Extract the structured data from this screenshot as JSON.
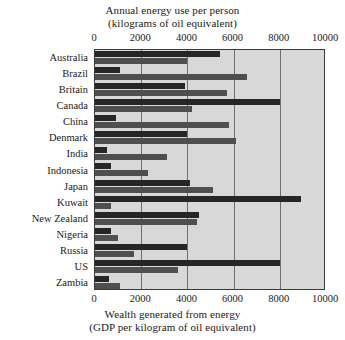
{
  "chart_data": {
    "type": "bar",
    "orientation": "horizontal",
    "title": "",
    "top_axis": {
      "label_line1": "Annual energy use per person",
      "label_line2": "(kilograms of oil equivalent)",
      "ticks": [
        0,
        2000,
        4000,
        6000,
        8000,
        10000
      ],
      "tick_labels": [
        "0",
        "2000",
        "4000",
        "6000",
        "8000",
        "10000"
      ],
      "xlim": [
        0,
        10000
      ]
    },
    "bottom_axis": {
      "label_line1": "Wealth generated from energy",
      "label_line2": "(GDP per kilogram of oil equivalent)",
      "ticks": [
        0,
        2000,
        4000,
        6000,
        8000,
        10000
      ],
      "tick_labels": [
        "0",
        "2000",
        "4000",
        "6000",
        "8000",
        "10000"
      ],
      "xlim": [
        0,
        10000
      ]
    },
    "categories": [
      "Australia",
      "Brazil",
      "Britain",
      "Canada",
      "China",
      "Denmark",
      "India",
      "Indonesia",
      "Japan",
      "Kuwait",
      "New Zealand",
      "Nigeria",
      "Russia",
      "US",
      "Zambia"
    ],
    "series": [
      {
        "name": "Annual energy use per person",
        "axis": "top",
        "color": "#262626",
        "values": [
          5400,
          1100,
          3900,
          8000,
          900,
          4000,
          500,
          700,
          4100,
          8900,
          4500,
          700,
          4000,
          8000,
          600
        ]
      },
      {
        "name": "Wealth generated from energy",
        "axis": "bottom",
        "color": "#4f4f4f",
        "values": [
          4000,
          6600,
          5700,
          4200,
          5800,
          6100,
          3100,
          2300,
          5100,
          700,
          4400,
          1000,
          1700,
          3600,
          1100
        ]
      }
    ],
    "grid": true,
    "legend_position": "none",
    "plot_background": "#d8d8d8"
  }
}
